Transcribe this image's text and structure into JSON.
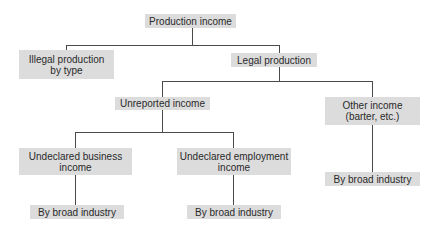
{
  "diagram": {
    "type": "tree",
    "nodes": {
      "root": {
        "label": "Production income"
      },
      "illegal": {
        "label": "Illegal production\nby type"
      },
      "legal": {
        "label": "Legal production"
      },
      "unreported": {
        "label": "Unreported income"
      },
      "other": {
        "label": "Other income\n(barter, etc.)"
      },
      "business": {
        "label": "Undeclared business\nincome"
      },
      "employment": {
        "label": "Undeclared employment\nincome"
      },
      "business_industry": {
        "label": "By broad industry"
      },
      "employment_industry": {
        "label": "By broad industry"
      },
      "other_industry": {
        "label": "By broad industry"
      }
    },
    "edges": [
      [
        "root",
        "illegal"
      ],
      [
        "root",
        "legal"
      ],
      [
        "legal",
        "unreported"
      ],
      [
        "legal",
        "other"
      ],
      [
        "unreported",
        "business"
      ],
      [
        "unreported",
        "employment"
      ],
      [
        "business",
        "business_industry"
      ],
      [
        "employment",
        "employment_industry"
      ],
      [
        "other",
        "other_industry"
      ]
    ],
    "colors": {
      "box_fill": "#dcdcdc",
      "line": "#4a4a4a",
      "text": "#2a2a2a"
    }
  }
}
